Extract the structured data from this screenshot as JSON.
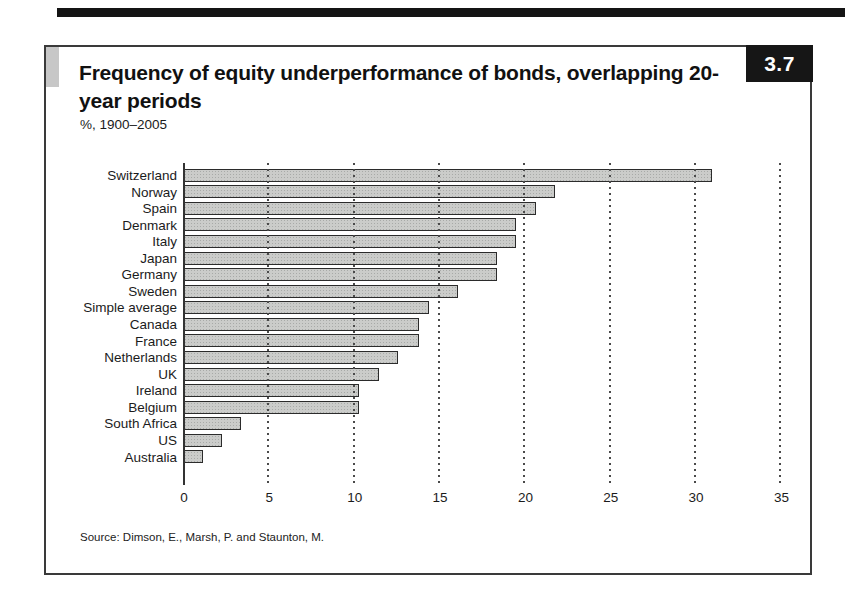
{
  "figure": {
    "number": "3.7",
    "title": "Frequency of equity underperformance of bonds, overlapping 20-year periods",
    "subtitle": "%, 1900–2005",
    "source": "Source: Dimson, E., Marsh, P. and Staunton, M."
  },
  "chart_data": {
    "type": "bar",
    "orientation": "horizontal",
    "title": "Frequency of equity underperformance of bonds, overlapping 20-year periods",
    "subtitle": "%, 1900–2005",
    "xlabel": "",
    "ylabel": "",
    "xlim": [
      0,
      35
    ],
    "xticks": [
      0,
      5,
      10,
      15,
      20,
      25,
      30,
      35
    ],
    "grid": "dotted-vertical",
    "legend": "none",
    "categories": [
      "Switzerland",
      "Norway",
      "Spain",
      "Denmark",
      "Italy",
      "Japan",
      "Germany",
      "Sweden",
      "Simple average",
      "Canada",
      "France",
      "Netherlands",
      "UK",
      "Ireland",
      "Belgium",
      "South Africa",
      "US",
      "Australia"
    ],
    "values": [
      31.0,
      21.8,
      20.7,
      19.5,
      19.5,
      18.4,
      18.4,
      16.1,
      14.4,
      13.8,
      13.8,
      12.6,
      11.5,
      10.3,
      10.3,
      3.4,
      2.3,
      1.2
    ]
  },
  "colors": {
    "top_bar": "#141414",
    "frame_border": "#3a3a3a",
    "badge_bg": "#161616",
    "badge_text": "#ffffff",
    "bar_fill": "#cbccca",
    "bar_stipple": "#a8aaa8",
    "bar_border": "#2b2b2b",
    "gridline": "#4a4a4a",
    "corner_block": "#c7c7c7",
    "text": "#1b1b1b"
  }
}
